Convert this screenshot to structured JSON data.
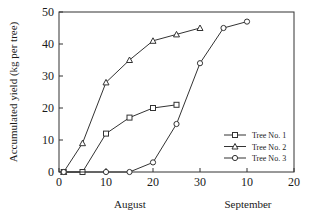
{
  "chart_data": {
    "type": "line",
    "title": "",
    "ylabel": "Accumulated yield (kg per tree)",
    "xlabel_groups": [
      "August",
      "September"
    ],
    "xlim": [
      0,
      50
    ],
    "ylim": [
      0,
      50
    ],
    "xticks": [
      {
        "value": 0,
        "label": "0"
      },
      {
        "value": 10,
        "label": "10"
      },
      {
        "value": 20,
        "label": "20"
      },
      {
        "value": 30,
        "label": "30"
      },
      {
        "value": 40,
        "label": "10"
      },
      {
        "value": 50,
        "label": "20"
      }
    ],
    "yticks": [
      {
        "value": 0,
        "label": "0"
      },
      {
        "value": 10,
        "label": "10"
      },
      {
        "value": 20,
        "label": "20"
      },
      {
        "value": 30,
        "label": "30"
      },
      {
        "value": 40,
        "label": "40"
      },
      {
        "value": 50,
        "label": "50"
      }
    ],
    "grid": false,
    "legend_position": "bottom-right",
    "series": [
      {
        "name": "Tree No. 1",
        "marker": "square",
        "x": [
          1,
          5,
          10,
          15,
          20,
          25
        ],
        "y": [
          0,
          0,
          12,
          17,
          20,
          21
        ]
      },
      {
        "name": "Tree No. 2",
        "marker": "triangle",
        "x": [
          1,
          5,
          10,
          15,
          20,
          25,
          30
        ],
        "y": [
          0,
          9,
          28,
          35,
          41,
          43,
          45
        ]
      },
      {
        "name": "Tree No. 3",
        "marker": "circle",
        "x": [
          1,
          10,
          15,
          20,
          25,
          30,
          35,
          40
        ],
        "y": [
          0,
          0,
          0,
          3,
          15,
          34,
          45,
          47
        ]
      }
    ]
  }
}
